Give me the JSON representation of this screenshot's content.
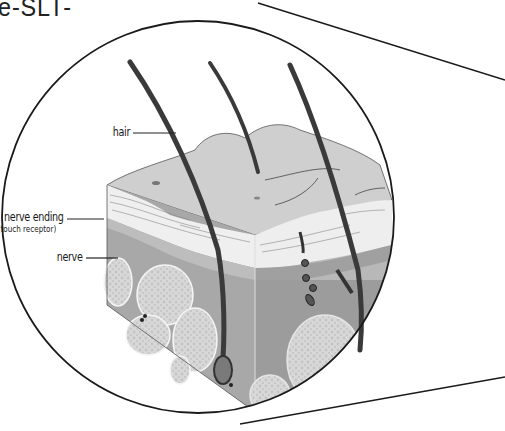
{
  "title_fragment": "e-SLT-",
  "diagram": {
    "labels": {
      "hair": "hair",
      "nerve_ending": "nerve ending",
      "nerve_ending_sub": "(touch receptor)",
      "nerve": "nerve"
    },
    "colors": {
      "outline": "#1a1a1a",
      "hair": "#3a3a3a",
      "epidermis_top": "#cfcfcf",
      "epidermis_white": "#f2f2f2",
      "dermis": "#a8a8a8",
      "dermis_dark": "#8f8f8f",
      "fat": "#d6d6d6",
      "background": "#ffffff"
    }
  }
}
